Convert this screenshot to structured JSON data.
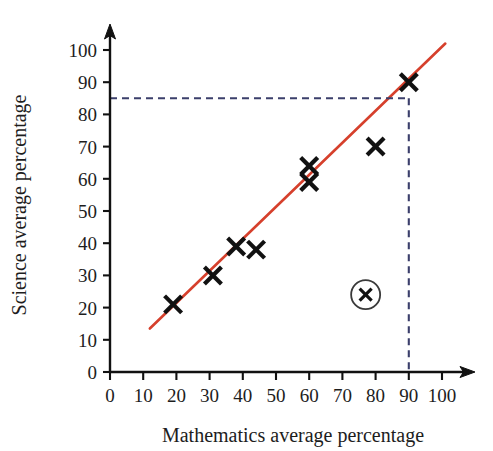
{
  "chart_data": {
    "type": "scatter",
    "title": "",
    "xlabel": "Mathematics average percentage",
    "ylabel": "Science average percentage",
    "xlim": [
      0,
      105
    ],
    "ylim": [
      0,
      105
    ],
    "xticks": [
      0,
      10,
      20,
      30,
      40,
      50,
      60,
      70,
      80,
      90,
      100
    ],
    "yticks": [
      0,
      10,
      20,
      30,
      40,
      50,
      60,
      70,
      80,
      90,
      100
    ],
    "xtick_labels": [
      "0",
      "10",
      "20",
      "30",
      "40",
      "50",
      "60",
      "70",
      "80",
      "90",
      "100"
    ],
    "ytick_labels": [
      "0",
      "10",
      "20",
      "30",
      "40",
      "50",
      "60",
      "70",
      "80",
      "90",
      "100"
    ],
    "grid": false,
    "legend": "none",
    "points": [
      {
        "x": 19,
        "y": 21,
        "marker": "x",
        "circled": false
      },
      {
        "x": 31,
        "y": 30,
        "marker": "x",
        "circled": false
      },
      {
        "x": 38,
        "y": 39,
        "marker": "x",
        "circled": false
      },
      {
        "x": 44,
        "y": 38,
        "marker": "x",
        "circled": false
      },
      {
        "x": 60,
        "y": 64,
        "marker": "x",
        "circled": false
      },
      {
        "x": 60,
        "y": 59,
        "marker": "x",
        "circled": false
      },
      {
        "x": 80,
        "y": 70,
        "marker": "x",
        "circled": false
      },
      {
        "x": 90,
        "y": 90,
        "marker": "x",
        "circled": false
      },
      {
        "x": 77,
        "y": 24,
        "marker": "x",
        "circled": true
      }
    ],
    "fit_line": {
      "name": "line of best fit",
      "color": "#d6402c",
      "x_start": 12,
      "y_start": 13.5,
      "x_end": 101,
      "y_end": 102
    },
    "guides": [
      {
        "name": "prediction-guide",
        "color": "#3b3f6b",
        "style": "dashed",
        "from_x": 0,
        "from_y": 85,
        "to_x": 90,
        "to_y": 85
      },
      {
        "name": "prediction-guide-vertical",
        "color": "#3b3f6b",
        "style": "dashed",
        "from_x": 90,
        "from_y": 85,
        "to_x": 90,
        "to_y": 0
      }
    ],
    "annotations": [
      {
        "name": "circled-point",
        "x": 77,
        "y": 24,
        "note": "circled cross marker"
      }
    ],
    "colors": {
      "fit_line": "#d6402c",
      "guide": "#3b3f6b",
      "marker": "#111111",
      "axis": "#111111",
      "background": "#ffffff"
    }
  }
}
